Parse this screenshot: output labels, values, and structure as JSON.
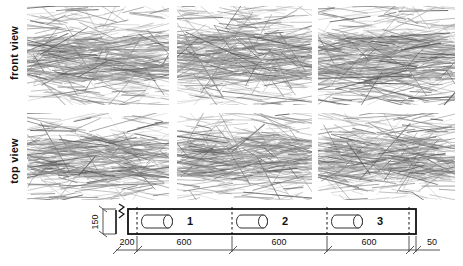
{
  "figure": {
    "row_labels": [
      {
        "id": "front",
        "text": "front view"
      },
      {
        "id": "top",
        "text": "top view"
      }
    ],
    "panel_count_per_row": 3,
    "specimen_description": "dense randomly oriented fibre network, predominantly horizontal alignment, greyscale line drawing"
  },
  "schematic": {
    "cylinders": [
      {
        "label": "1"
      },
      {
        "label": "2"
      },
      {
        "label": "3"
      }
    ],
    "dimensions": {
      "height_label": "150",
      "horizontal": [
        "200",
        "600",
        "600",
        "600",
        "50"
      ]
    }
  },
  "chart_data": {
    "type": "table",
    "title": "",
    "categories": [
      "200",
      "600",
      "600",
      "600",
      "50"
    ],
    "values": [
      200,
      600,
      600,
      600,
      50
    ],
    "series": [
      {
        "name": "segment lengths",
        "values": [
          200,
          600,
          600,
          600,
          50
        ]
      }
    ],
    "annotations": [
      "150",
      "1",
      "2",
      "3"
    ],
    "xlabel": "",
    "ylabel": "",
    "grid": false,
    "legend": "none"
  },
  "colors": {
    "fiber_dark": "#5a5a5a",
    "fiber_mid": "#8a8a8a",
    "fiber_light": "#b4b4b4",
    "outline": "#111111",
    "dim_line": "#444444",
    "background": "#ffffff"
  }
}
